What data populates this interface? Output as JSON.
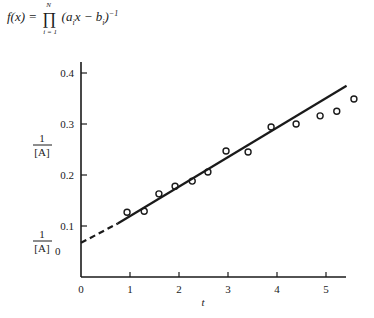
{
  "formula": {
    "lhs": "f(x) = ",
    "prod_symbol": "∏",
    "prod_upper": "N",
    "prod_lower": "i = 1",
    "body_open": "(a",
    "body_sub_a": "i",
    "body_mid": "x − b",
    "body_sub_b": "i",
    "body_close": ")",
    "exponent": "−1"
  },
  "chart_data": {
    "type": "scatter",
    "title": "",
    "xlabel": "t",
    "ylabel": "1/[A]",
    "y_intercept_label": "1/[A]0",
    "xlim": [
      0,
      5.5
    ],
    "ylim": [
      0,
      0.42
    ],
    "grid": false,
    "x_ticks": [
      0,
      1,
      2,
      3,
      4,
      5
    ],
    "y_ticks": [
      0.1,
      0.2,
      0.3,
      0.4
    ],
    "x_tick_labels": [
      "0",
      "1",
      "2",
      "3",
      "4",
      "5"
    ],
    "y_tick_labels": [
      "0.1",
      "0.2",
      "0.3",
      "0.4"
    ],
    "series": [
      {
        "name": "data",
        "marker": "open-circle",
        "x": [
          0.94,
          1.29,
          1.59,
          1.92,
          2.27,
          2.59,
          2.96,
          3.41,
          3.88,
          4.39,
          4.88,
          5.22,
          5.57
        ],
        "y": [
          0.127,
          0.129,
          0.163,
          0.178,
          0.188,
          0.206,
          0.247,
          0.245,
          0.294,
          0.3,
          0.316,
          0.325,
          0.349
        ]
      },
      {
        "name": "linear fit",
        "style": "solid",
        "x": [
          0.75,
          5.42
        ],
        "y": [
          0.105,
          0.375
        ]
      },
      {
        "name": "extrapolation",
        "style": "dashed",
        "x": [
          0.0,
          0.75
        ],
        "y": [
          0.067,
          0.105
        ]
      }
    ]
  },
  "labels": {
    "y_axis_num": "1",
    "y_axis_den": "[A]",
    "y0_num": "1",
    "y0_den": "[A]",
    "y0_sub": "0",
    "x_axis": "t"
  }
}
